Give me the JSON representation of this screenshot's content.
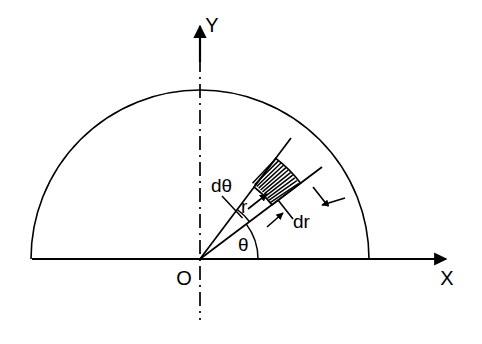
{
  "figure": {
    "background_color": "#ffffff",
    "stroke_color": "#000000",
    "width": 482,
    "height": 344
  },
  "axes": {
    "x_axis": {
      "label": "X",
      "label_x": 447,
      "label_y": 284,
      "line_start_x": 32,
      "line_end_x": 452,
      "line_y": 259,
      "arrow": "right-arrow"
    },
    "y_axis": {
      "label": "Y",
      "label_x": 211,
      "label_y": 30,
      "line_top_y": 24,
      "line_y": 259,
      "line_x": 200,
      "arrow": "up-arrow",
      "style": "dash-dot",
      "extends_below_axis_to_y": 320
    },
    "origin": {
      "label": "O",
      "label_x": 183,
      "label_y": 284,
      "x": 200,
      "y": 259
    }
  },
  "geometry": {
    "semicircle": {
      "center_x": 200,
      "center_y": 259,
      "radius": 169,
      "start_angle_deg": 0,
      "end_angle_deg": 180
    },
    "element": {
      "theta_deg": 37,
      "dtheta_deg": 16,
      "r_inner": 90,
      "r_outer": 126,
      "hatch_line_count": 11,
      "ray_length": 150
    }
  },
  "labels": {
    "dtheta": {
      "text": "dθ",
      "x": 211,
      "y": 192
    },
    "r": {
      "text": "r",
      "x": 243,
      "y": 212
    },
    "dr": {
      "text": "dr",
      "x": 296,
      "y": 227
    },
    "theta": {
      "text": "θ",
      "x": 242,
      "y": 250
    },
    "x_axis": {
      "text": "X"
    },
    "y_axis": {
      "text": "Y"
    },
    "origin": {
      "text": "O"
    }
  }
}
